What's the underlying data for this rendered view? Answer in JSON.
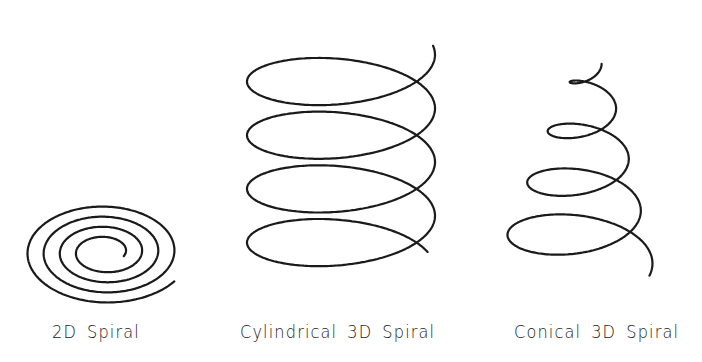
{
  "figure": {
    "background": "#ffffff",
    "stroke_color": "#1a1a1a",
    "panels": [
      {
        "id": "2d",
        "label": "2D Spiral",
        "type": "planar-spiral",
        "turns": 4,
        "center": [
          105,
          254
        ],
        "outer_radius": [
          84,
          52
        ],
        "inner_radius": [
          20,
          12
        ],
        "label_x": 52
      },
      {
        "id": "cylindrical",
        "label": "Cylindrical 3D Spiral",
        "type": "cylindrical-helix",
        "turns": 4,
        "center_x": 341,
        "radius": [
          94,
          36
        ],
        "top_y": 53,
        "bottom_y": 266,
        "label_x": 240
      },
      {
        "id": "conical",
        "label": "Conical 3D Spiral",
        "type": "conical-helix",
        "turns": 4,
        "apex": [
          592,
          62
        ],
        "base_center": [
          575,
          265
        ],
        "base_radius": [
          78,
          36
        ],
        "top_radius": [
          10,
          6
        ],
        "label_x": 514
      }
    ]
  }
}
